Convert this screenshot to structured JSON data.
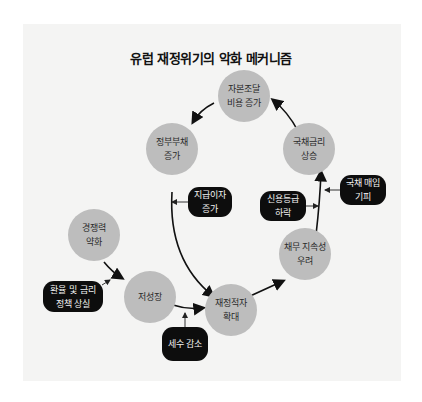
{
  "title": "유럽 재정위기의 악화 메커니즘",
  "colors": {
    "panel": "#f4f4f3",
    "node": "#bdbdbd",
    "factor": "#0d0d0d",
    "arrow": "#111111"
  },
  "nodes": [
    {
      "id": "funding-cost",
      "label": "자본조달\n비용 증가"
    },
    {
      "id": "gov-debt",
      "label": "정부부채\n증가"
    },
    {
      "id": "bond-rate",
      "label": "국채금리\n상승"
    },
    {
      "id": "competitiveness",
      "label": "경쟁력\n약화"
    },
    {
      "id": "low-growth",
      "label": "저성장"
    },
    {
      "id": "deficit",
      "label": "재정적자\n확대"
    },
    {
      "id": "sustainability",
      "label": "채무 지속성\n우려"
    }
  ],
  "factors": [
    {
      "id": "interest-payment",
      "label": "지급이자\n증가"
    },
    {
      "id": "credit-rating",
      "label": "신용등급\n하락"
    },
    {
      "id": "bond-avoid",
      "label": "국채 매입\n기피"
    },
    {
      "id": "fx-policy",
      "label": "환율 및 금리\n정책 상실"
    },
    {
      "id": "tax-revenue",
      "label": "세수 감소"
    }
  ]
}
